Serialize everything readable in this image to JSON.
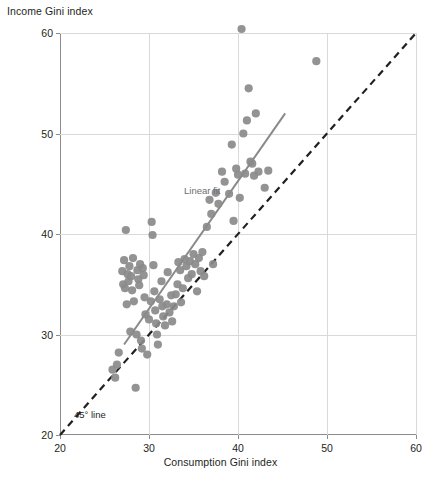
{
  "chart_data": {
    "type": "scatter",
    "title": "",
    "xlabel": "Consumption Gini index",
    "ylabel": "Income Gini index",
    "xlim": [
      20,
      60
    ],
    "ylim": [
      20,
      60
    ],
    "xticks": [
      20,
      30,
      40,
      50,
      60
    ],
    "yticks": [
      20,
      30,
      40,
      50,
      60
    ],
    "grid": true,
    "legend_position": "inline-annotations",
    "annotations": [
      {
        "text": "Linear fit",
        "x": 33.5,
        "y": 44.0
      },
      {
        "text": "45° line",
        "x": 21.8,
        "y": 21.9
      }
    ],
    "series": [
      {
        "name": "Countries",
        "marker_color": "#8a8a8a",
        "points": [
          [
            25.9,
            26.5
          ],
          [
            26.2,
            25.7
          ],
          [
            26.4,
            27.0
          ],
          [
            26.6,
            28.2
          ],
          [
            27.0,
            36.3
          ],
          [
            27.1,
            35.0
          ],
          [
            27.2,
            37.4
          ],
          [
            27.3,
            34.6
          ],
          [
            27.4,
            40.4
          ],
          [
            27.5,
            33.0
          ],
          [
            27.6,
            36.0
          ],
          [
            27.7,
            35.3
          ],
          [
            27.8,
            36.8
          ],
          [
            27.9,
            30.3
          ],
          [
            28.0,
            35.8
          ],
          [
            28.1,
            34.4
          ],
          [
            28.2,
            37.6
          ],
          [
            28.3,
            33.3
          ],
          [
            28.5,
            24.7
          ],
          [
            28.6,
            30.0
          ],
          [
            28.7,
            36.4
          ],
          [
            28.8,
            35.5
          ],
          [
            28.9,
            34.9
          ],
          [
            29.0,
            37.0
          ],
          [
            29.1,
            29.4
          ],
          [
            29.2,
            28.6
          ],
          [
            29.3,
            36.6
          ],
          [
            29.4,
            35.9
          ],
          [
            29.5,
            33.7
          ],
          [
            29.6,
            32.0
          ],
          [
            29.8,
            28.0
          ],
          [
            30.0,
            31.5
          ],
          [
            30.2,
            33.3
          ],
          [
            30.3,
            41.2
          ],
          [
            30.4,
            39.9
          ],
          [
            30.5,
            36.9
          ],
          [
            30.6,
            34.3
          ],
          [
            30.7,
            32.4
          ],
          [
            30.8,
            31.1
          ],
          [
            30.9,
            30.0
          ],
          [
            31.0,
            29.0
          ],
          [
            31.2,
            33.5
          ],
          [
            31.4,
            35.3
          ],
          [
            31.5,
            32.8
          ],
          [
            31.6,
            31.8
          ],
          [
            31.8,
            30.9
          ],
          [
            32.0,
            33.0
          ],
          [
            32.1,
            36.2
          ],
          [
            32.3,
            32.2
          ],
          [
            32.5,
            33.9
          ],
          [
            32.6,
            31.3
          ],
          [
            32.8,
            32.8
          ],
          [
            33.0,
            34.0
          ],
          [
            33.2,
            35.0
          ],
          [
            33.3,
            37.2
          ],
          [
            33.5,
            36.4
          ],
          [
            33.6,
            33.2
          ],
          [
            33.8,
            34.6
          ],
          [
            34.0,
            37.5
          ],
          [
            34.2,
            36.8
          ],
          [
            34.4,
            35.6
          ],
          [
            34.6,
            37.3
          ],
          [
            34.8,
            36.0
          ],
          [
            35.0,
            38.0
          ],
          [
            35.2,
            37.0
          ],
          [
            35.4,
            34.3
          ],
          [
            35.6,
            37.6
          ],
          [
            35.8,
            36.3
          ],
          [
            36.0,
            38.2
          ],
          [
            36.2,
            35.8
          ],
          [
            36.5,
            40.7
          ],
          [
            36.8,
            43.4
          ],
          [
            37.0,
            42.0
          ],
          [
            37.2,
            37.0
          ],
          [
            37.5,
            44.1
          ],
          [
            37.8,
            43.0
          ],
          [
            38.2,
            46.2
          ],
          [
            38.5,
            45.2
          ],
          [
            39.0,
            44.0
          ],
          [
            39.3,
            48.9
          ],
          [
            39.5,
            41.3
          ],
          [
            39.8,
            46.5
          ],
          [
            40.0,
            45.9
          ],
          [
            40.2,
            43.6
          ],
          [
            40.4,
            60.4
          ],
          [
            40.6,
            50.0
          ],
          [
            40.8,
            46.0
          ],
          [
            41.0,
            51.3
          ],
          [
            41.2,
            54.5
          ],
          [
            41.4,
            47.2
          ],
          [
            41.6,
            47.0
          ],
          [
            41.8,
            45.8
          ],
          [
            42.0,
            52.0
          ],
          [
            42.3,
            46.2
          ],
          [
            43.0,
            44.6
          ],
          [
            43.4,
            46.3
          ],
          [
            48.8,
            57.2
          ]
        ]
      }
    ],
    "fit_line": {
      "name": "Linear fit",
      "color": "#8a8a8a",
      "x": [
        27.2,
        45.3
      ],
      "y": [
        29.0,
        52.0
      ]
    },
    "reference_line": {
      "name": "45° line",
      "color": "#231f20",
      "style": "dashed",
      "x": [
        20,
        60
      ],
      "y": [
        20,
        60
      ]
    }
  }
}
